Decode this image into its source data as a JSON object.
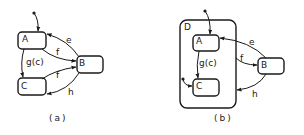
{
  "figure": {
    "diagrams": [
      {
        "id": "a",
        "caption": "(a)",
        "states": [
          {
            "name": "A",
            "label": "A"
          },
          {
            "name": "B",
            "label": "B"
          },
          {
            "name": "C",
            "label": "C"
          }
        ],
        "transitions": [
          {
            "from": "default",
            "to": "A",
            "label": ""
          },
          {
            "from": "B",
            "to": "A",
            "label": "e"
          },
          {
            "from": "A",
            "to": "B",
            "label": "f"
          },
          {
            "from": "A",
            "to": "C",
            "label": "g(c)"
          },
          {
            "from": "C",
            "to": "B",
            "label": "f"
          },
          {
            "from": "B",
            "to": "C",
            "label": "h"
          }
        ]
      },
      {
        "id": "b",
        "caption": "(b)",
        "superstate": {
          "name": "D",
          "label": "D"
        },
        "states": [
          {
            "name": "A",
            "label": "A"
          },
          {
            "name": "B",
            "label": "B"
          },
          {
            "name": "C",
            "label": "C"
          }
        ],
        "transitions": [
          {
            "from": "default",
            "to": "A",
            "label": ""
          },
          {
            "from": "default",
            "to": "C",
            "label": ""
          },
          {
            "from": "B",
            "to": "A",
            "label": "e"
          },
          {
            "from": "D",
            "to": "B",
            "label": "f"
          },
          {
            "from": "A",
            "to": "C",
            "label": "g(c)"
          },
          {
            "from": "B",
            "to": "D",
            "label": "h"
          }
        ]
      }
    ]
  }
}
